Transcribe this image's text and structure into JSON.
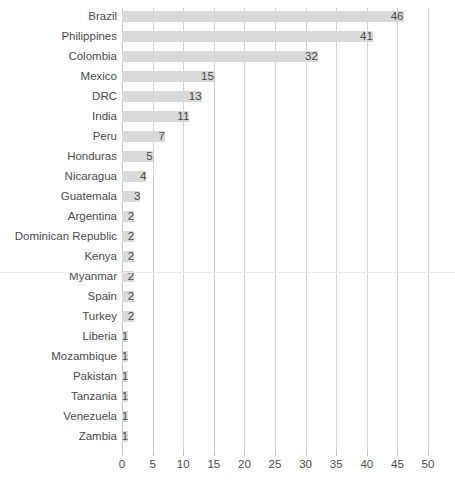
{
  "chart_data": {
    "type": "bar",
    "orientation": "horizontal",
    "title": "",
    "subtitle": "",
    "xlabel": "",
    "ylabel": "",
    "xlim": [
      0,
      50
    ],
    "xticks": [
      0,
      5,
      10,
      15,
      20,
      25,
      30,
      35,
      40,
      45,
      50
    ],
    "xtick_labels": [
      "0",
      "5",
      "10",
      "15",
      "20",
      "25",
      "30",
      "35",
      "40",
      "45",
      "50"
    ],
    "grid": "vertical",
    "legend": "none",
    "data_labels": true,
    "categories": [
      "Brazil",
      "Philippines",
      "Colombia",
      "Mexico",
      "DRC",
      "India",
      "Peru",
      "Honduras",
      "Nicaragua",
      "Guatemala",
      "Argentina",
      "Dominican Republic",
      "Kenya",
      "Myanmar",
      "Spain",
      "Turkey",
      "Liberia",
      "Mozambique",
      "Pakistan",
      "Tanzania",
      "Venezuela",
      "Zambia"
    ],
    "values": [
      46,
      41,
      32,
      15,
      13,
      11,
      7,
      5,
      4,
      3,
      2,
      2,
      2,
      2,
      2,
      2,
      1,
      1,
      1,
      1,
      1,
      1
    ],
    "value_labels": [
      "46",
      "41",
      "32",
      "15",
      "13",
      "11",
      "7",
      "5",
      "4",
      "3",
      "2",
      "2",
      "2",
      "2",
      "2",
      "2",
      "1",
      "1",
      "1",
      "1",
      "1",
      "1"
    ]
  },
  "style": {
    "bar_color": "#d9d9d9",
    "grid_color": "#d2d2d2",
    "text_color": "#4a4a4a",
    "background_color": "#ffffff",
    "divider_color": "#ececec"
  }
}
